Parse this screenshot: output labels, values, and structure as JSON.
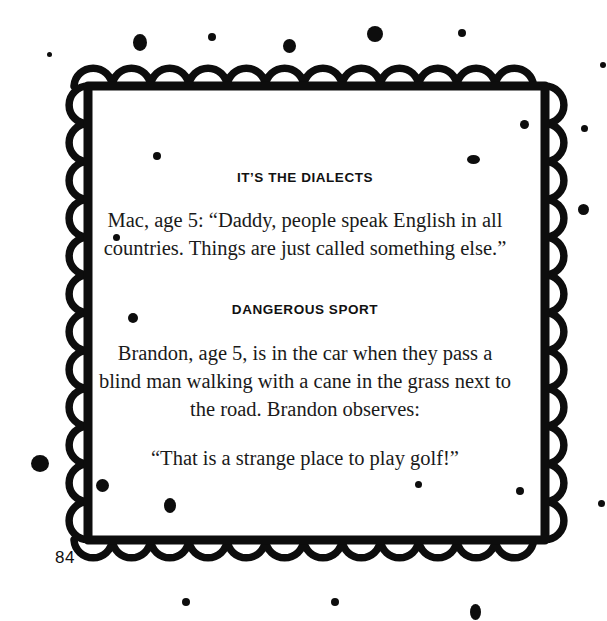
{
  "page": {
    "number": "84",
    "background_color": "#ffffff",
    "ink_color": "#0d0d0d"
  },
  "border": {
    "style": "scalloped-cloud-frame",
    "color": "#0d0d0d",
    "top_scallops": 12,
    "bottom_scallops": 12,
    "left_scallops": 13,
    "right_scallops": 13
  },
  "entries": [
    {
      "heading": "IT’S THE DIALECTS",
      "body": "Mac, age 5: “Daddy, people speak English in all countries. Things are just called something else.”"
    },
    {
      "heading": "DANGEROUS SPORT",
      "body": "Brandon, age 5, is in the car when they pass a blind man walking with a cane in the grass next to the road. Brandon observes:",
      "quote": "“That is a strange place to play golf!”"
    }
  ]
}
